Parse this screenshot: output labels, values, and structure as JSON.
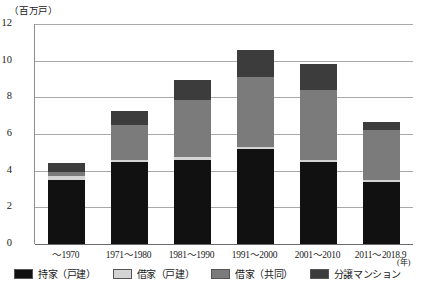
{
  "chart_data": {
    "type": "bar",
    "title": "",
    "subtitle": "",
    "stacked": true,
    "xlabel": "(年)",
    "ylabel": "（百万戸）",
    "ylim": [
      0,
      12
    ],
    "yticks": [
      0,
      2,
      4,
      6,
      8,
      10,
      12
    ],
    "grid": true,
    "legend_position": "bottom",
    "categories": [
      "〜1970",
      "1971〜1980",
      "1981〜1990",
      "1991〜2000",
      "2001〜2010",
      "2011〜2018.9"
    ],
    "series": [
      {
        "name": "持家（戸建）",
        "color": "#111111",
        "values": [
          3.5,
          4.45,
          4.6,
          5.2,
          4.5,
          3.4
        ]
      },
      {
        "name": "借家（戸建）",
        "color": "#d4d4d4",
        "values": [
          0.2,
          0.15,
          0.15,
          0.1,
          0.1,
          0.08
        ]
      },
      {
        "name": "借家（共同）",
        "color": "#7b7b7b",
        "values": [
          0.25,
          1.9,
          3.1,
          3.8,
          3.8,
          2.72
        ]
      },
      {
        "name": "分譲マンション",
        "color": "#3c3c3c",
        "values": [
          0.45,
          0.75,
          1.1,
          1.5,
          1.4,
          0.45
        ]
      }
    ],
    "totals": [
      4.4,
      7.25,
      8.95,
      10.6,
      9.8,
      6.65
    ]
  },
  "axis": {
    "unit_y": "（百万戸）",
    "unit_x": "(年)",
    "ticks": [
      "12",
      "10",
      "8",
      "6",
      "4",
      "2",
      "0"
    ]
  },
  "legend": {
    "items": [
      {
        "label": "持家（戸建）"
      },
      {
        "label": "借家（戸建）"
      },
      {
        "label": "借家（共同）"
      },
      {
        "label": "分譲マンション"
      }
    ]
  }
}
